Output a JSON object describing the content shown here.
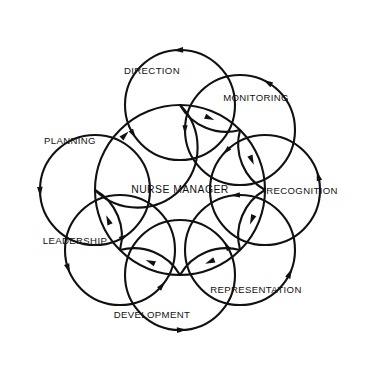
{
  "diagram": {
    "type": "overlapping-circles-cycle",
    "background_color": "#ffffff",
    "line_color": "#111111",
    "center": {
      "label": "NURSE MANAGER",
      "cx": 180,
      "cy": 190,
      "r": 85
    },
    "rotation_direction": "counterclockwise",
    "nodes": [
      {
        "label": "DIRECTION",
        "angle_deg": 270,
        "cx": 180,
        "cy": 105,
        "r": 55,
        "label_x": 152,
        "label_y": 71,
        "arrow_angle_deg": 268
      },
      {
        "label": "MONITORING",
        "angle_deg": 315,
        "cx": 240,
        "cy": 130,
        "r": 55,
        "label_x": 256,
        "label_y": 98,
        "arrow_angle_deg": 300
      },
      {
        "label": "RECOGNITION",
        "angle_deg": 0,
        "cx": 265,
        "cy": 190,
        "r": 55,
        "label_x": 302,
        "label_y": 191,
        "arrow_angle_deg": 345
      },
      {
        "label": "REPRESENTATION",
        "angle_deg": 45,
        "cx": 240,
        "cy": 250,
        "r": 55,
        "label_x": 256,
        "label_y": 290,
        "arrow_angle_deg": 25
      },
      {
        "label": "DEVELOPMENT",
        "angle_deg": 90,
        "cx": 180,
        "cy": 275,
        "r": 55,
        "label_x": 152,
        "label_y": 315,
        "arrow_angle_deg": 88
      },
      {
        "label": "LEADERSHIP",
        "angle_deg": 135,
        "cx": 120,
        "cy": 250,
        "r": 55,
        "label_x": 75,
        "label_y": 241,
        "arrow_angle_deg": 160
      },
      {
        "label": "PLANNING",
        "angle_deg": 180,
        "cx": 95,
        "cy": 190,
        "r": 55,
        "label_x": 70,
        "label_y": 141,
        "arrow_angle_deg": 178
      },
      {
        "label": "LEADERSHIP_TOPLEFT_SPACER",
        "angle_deg": 225,
        "cx": 120,
        "cy": 130,
        "r": 55,
        "label_x": 0,
        "label_y": 0,
        "arrow_angle_deg": 215,
        "hidden": true
      }
    ]
  }
}
